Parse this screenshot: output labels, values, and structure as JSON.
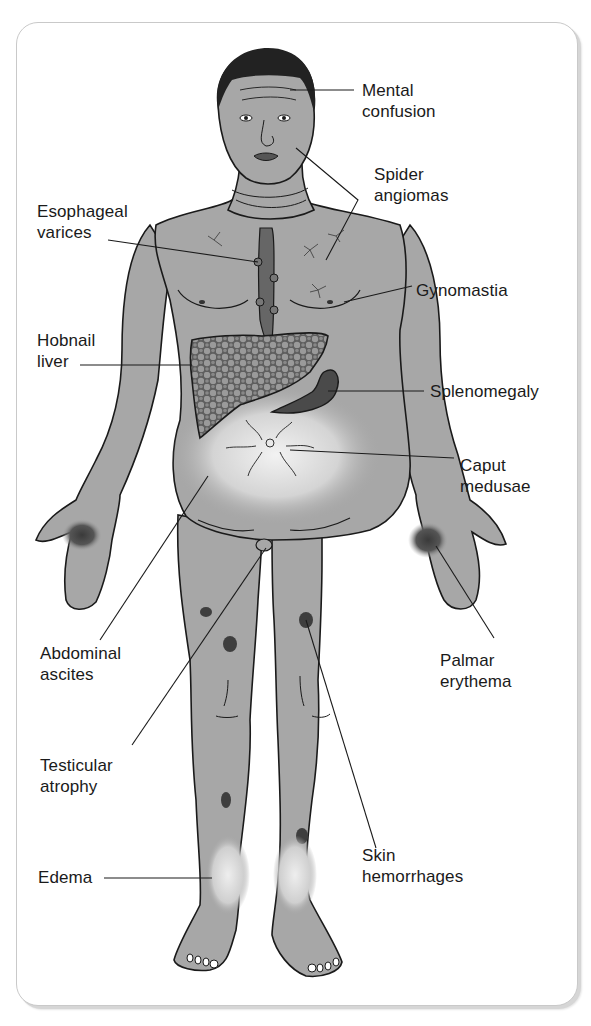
{
  "figure": {
    "colors": {
      "skin": "#a7a7a7",
      "outline": "#1a1a1a",
      "hair": "#222222",
      "liver": "#5e5e5e",
      "liver_nodules": "#9a9a9a",
      "spleen": "#4a4a4a",
      "hemorrhage": "#3e3e3e",
      "frame_border": "#c9c9c9"
    }
  },
  "labels": {
    "mental_confusion": {
      "line1": "Mental",
      "line2": "confusion"
    },
    "spider_angiomas": {
      "line1": "Spider",
      "line2": "angiomas"
    },
    "esophageal_varices": {
      "line1": "Esophageal",
      "line2": "varices"
    },
    "gynomastia": {
      "line1": "Gynomastia"
    },
    "hobnail_liver": {
      "line1": "Hobnail",
      "line2": "liver"
    },
    "splenomegaly": {
      "line1": "Splenomegaly"
    },
    "caput_medusae": {
      "line1": "Caput",
      "line2": "medusae"
    },
    "abdominal_ascites": {
      "line1": "Abdominal",
      "line2": "ascites"
    },
    "palmar_erythema": {
      "line1": "Palmar",
      "line2": "erythema"
    },
    "testicular_atrophy": {
      "line1": "Testicular",
      "line2": "atrophy"
    },
    "skin_hemorrhages": {
      "line1": "Skin",
      "line2": "hemorrhages"
    },
    "edema": {
      "line1": "Edema"
    }
  }
}
